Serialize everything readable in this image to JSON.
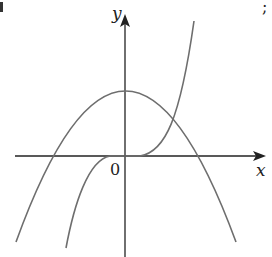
{
  "diagram": {
    "type": "function-graph",
    "axes": {
      "x_label": "x",
      "y_label": "y",
      "origin_label": "0"
    },
    "curves": [
      {
        "name": "parabola",
        "shape": "downward-opening parabola, vertex on positive y-axis, two x-intercepts symmetric about y-axis"
      },
      {
        "name": "cubic",
        "shape": "cubic y = kx^3 style, passes through origin with horizontal inflection, increasing"
      }
    ],
    "edge_fragments": {
      "top_left": "",
      "top_right": ";"
    },
    "colors": {
      "axis": "#222222",
      "curve": "#6e6e6e",
      "background": "#ffffff"
    }
  }
}
